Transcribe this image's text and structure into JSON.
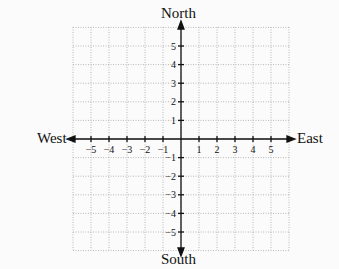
{
  "directions": {
    "north": "North",
    "south": "South",
    "east": "East",
    "west": "West"
  },
  "x_ticks": [
    "−5",
    "−4",
    "−3",
    "−2",
    "−1",
    "1",
    "2",
    "3",
    "4",
    "5"
  ],
  "y_ticks": [
    "5",
    "4",
    "3",
    "2",
    "1",
    "−1",
    "−2",
    "−3",
    "−4",
    "−5"
  ],
  "colors": {
    "axis": "#111111",
    "grid": "#b8b8b8",
    "background": "#fbfbfb"
  }
}
